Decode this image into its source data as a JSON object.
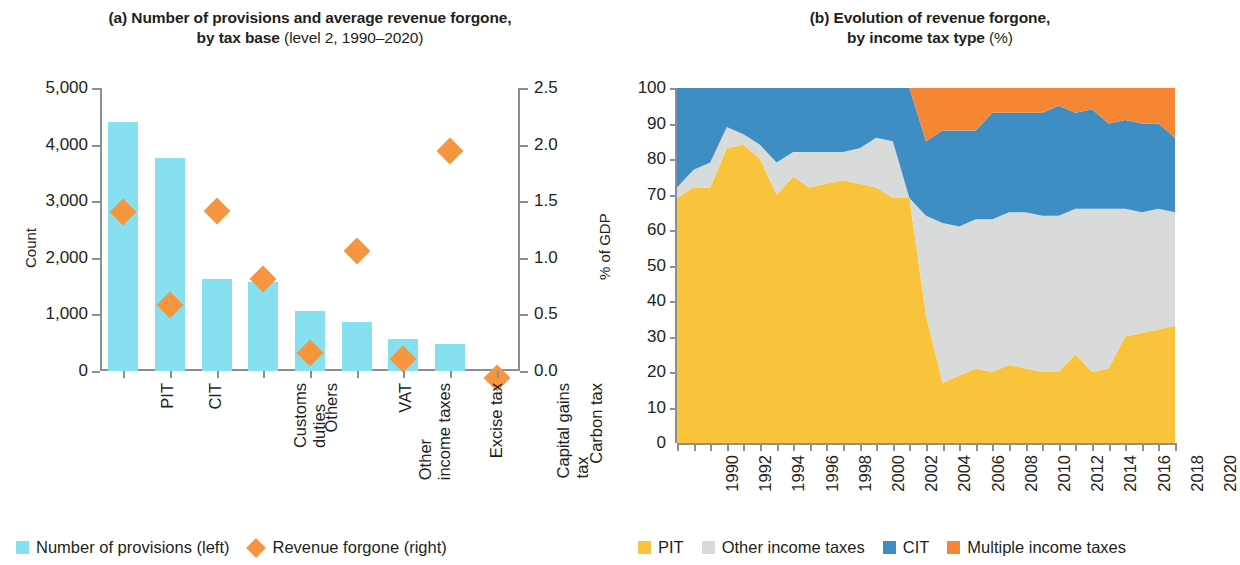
{
  "figure": {
    "panel_a": {
      "title_main": "(a) Number of provisions and average revenue forgone,",
      "title_second_bold": "by tax base ",
      "title_second_light": "(level 2, 1990–2020)",
      "y_left_title": "Count",
      "y_right_title": "% of GDP",
      "y_left_ticks": [
        "5,000",
        "4,000",
        "3,000",
        "2,000",
        "1,000",
        "0"
      ],
      "y_right_ticks": [
        "2.5",
        "2.0",
        "1.5",
        "1.0",
        "0.5",
        "0.0"
      ],
      "legend": [
        {
          "label": "Number of provisions (left)",
          "color": "#86e0f0",
          "marker": "square"
        },
        {
          "label": "Revenue forgone (right)",
          "color": "#f5953f",
          "marker": "diamond"
        }
      ]
    },
    "panel_b": {
      "title_main": "(b) Evolution of revenue forgone,",
      "title_second_bold": "by income tax type ",
      "title_second_light": "(%)",
      "y_ticks": [
        "100",
        "90",
        "80",
        "70",
        "60",
        "50",
        "40",
        "30",
        "20",
        "10",
        "0"
      ],
      "legend": [
        {
          "label": "PIT",
          "color": "#f9c33c"
        },
        {
          "label": "Other income taxes",
          "color": "#d9dada"
        },
        {
          "label": "CIT",
          "color": "#3e8ec4"
        },
        {
          "label": "Multiple income taxes",
          "color": "#f58634"
        }
      ]
    }
  },
  "chart_data": [
    {
      "type": "bar",
      "id": "panel-a",
      "title": "(a) Number of provisions and average revenue forgone, by tax base (level 2, 1990–2020)",
      "xlabel": "",
      "ylabel": "Count",
      "ylabel_secondary": "% of GDP",
      "ylim": [
        0,
        5000
      ],
      "ylim_secondary": [
        0,
        2.5
      ],
      "grid": false,
      "categories": [
        "PIT",
        "CIT",
        "Customs duties",
        "Others",
        "Other income taxes",
        "VAT",
        "Excise tax",
        "Capital gains tax",
        "Carbon tax"
      ],
      "series": [
        {
          "name": "Number of provisions (left)",
          "type": "bar",
          "axis": "left",
          "color": "#86e0f0",
          "values": [
            4400,
            3760,
            1620,
            1580,
            1060,
            860,
            560,
            470,
            0
          ]
        },
        {
          "name": "Revenue forgone (right)",
          "type": "scatter",
          "axis": "right",
          "color": "#f5953f",
          "marker": "diamond",
          "values": [
            1.49,
            0.67,
            1.5,
            0.9,
            0.24,
            1.14,
            0.19,
            2.03,
            0.02
          ]
        }
      ]
    },
    {
      "type": "area",
      "id": "panel-b",
      "title": "(b) Evolution of revenue forgone, by income tax type (%)",
      "xlabel": "",
      "ylabel": "",
      "stacked": true,
      "ylim": [
        0,
        100
      ],
      "grid": false,
      "legend_position": "bottom",
      "x": [
        1990,
        1991,
        1992,
        1993,
        1994,
        1995,
        1996,
        1997,
        1998,
        1999,
        2000,
        2001,
        2002,
        2003,
        2004,
        2005,
        2006,
        2007,
        2008,
        2009,
        2010,
        2011,
        2012,
        2013,
        2014,
        2015,
        2016,
        2017,
        2018,
        2019,
        2020
      ],
      "xtick_labels": [
        "1990",
        "1992",
        "1994",
        "1996",
        "1998",
        "2000",
        "2002",
        "2004",
        "2006",
        "2008",
        "2010",
        "2012",
        "2014",
        "2016",
        "2018",
        "2020"
      ],
      "series": [
        {
          "name": "PIT",
          "color": "#f9c33c",
          "values": [
            69,
            72,
            72,
            83,
            84,
            80,
            70,
            75,
            72,
            73,
            74,
            73,
            72,
            69,
            69,
            36,
            17,
            19,
            21,
            20,
            22,
            21,
            20,
            20,
            25,
            20,
            21,
            30,
            31,
            32,
            33
          ]
        },
        {
          "name": "Other income taxes",
          "color": "#d9dada",
          "values": [
            3,
            5,
            7,
            6,
            3,
            4,
            9,
            7,
            10,
            9,
            8,
            10,
            14,
            16,
            0,
            28,
            45,
            42,
            42,
            43,
            43,
            44,
            44,
            44,
            41,
            46,
            45,
            36,
            34,
            34,
            32
          ]
        },
        {
          "name": "CIT",
          "color": "#3e8ec4",
          "values": [
            28,
            23,
            21,
            11,
            13,
            16,
            21,
            18,
            18,
            18,
            18,
            17,
            14,
            15,
            31,
            21,
            26,
            27,
            25,
            30,
            28,
            28,
            29,
            31,
            27,
            28,
            24,
            25,
            25,
            24,
            21
          ]
        },
        {
          "name": "Multiple income taxes",
          "color": "#f58634",
          "values": [
            0,
            0,
            0,
            0,
            0,
            0,
            0,
            0,
            0,
            0,
            0,
            0,
            0,
            0,
            0,
            15,
            12,
            12,
            12,
            7,
            7,
            7,
            7,
            5,
            7,
            6,
            10,
            9,
            10,
            10,
            14
          ]
        }
      ]
    }
  ]
}
